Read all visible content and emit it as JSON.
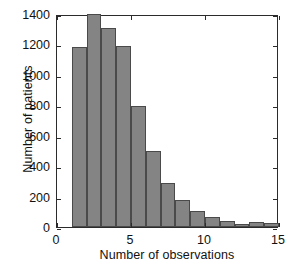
{
  "chart_data": {
    "type": "bar",
    "title": "",
    "subtitle": "",
    "xlabel": "Number of observations",
    "ylabel": "Number of patients",
    "xlim": [
      0,
      15
    ],
    "ylim": [
      0,
      1400
    ],
    "xticks": [
      0,
      5,
      10,
      15
    ],
    "xtick_labels": [
      "0",
      "5",
      "10",
      "15"
    ],
    "yticks": [
      0,
      200,
      400,
      600,
      800,
      1000,
      1200,
      1400
    ],
    "ytick_labels": [
      "0",
      "200",
      "400",
      "600",
      "800",
      "1000",
      "1200",
      "1400"
    ],
    "grid": false,
    "legend": null,
    "bin_width": 1,
    "bin_edges": [
      1,
      2,
      3,
      4,
      5,
      6,
      7,
      8,
      9,
      10,
      11,
      12,
      13,
      14,
      15
    ],
    "categories": [
      "1-2",
      "2-3",
      "3-4",
      "4-5",
      "5-6",
      "6-7",
      "7-8",
      "8-9",
      "9-10",
      "10-11",
      "11-12",
      "12-13",
      "13-14",
      "14-15"
    ],
    "x": [
      1.5,
      2.5,
      3.5,
      4.5,
      5.5,
      6.5,
      7.5,
      8.5,
      9.5,
      10.5,
      11.5,
      12.5,
      13.5,
      14.5
    ],
    "values": [
      1180,
      1400,
      1310,
      1190,
      795,
      500,
      290,
      175,
      105,
      65,
      38,
      22,
      30,
      25
    ],
    "bar_color": "#848484",
    "bar_edge_color": "#4a4a4a",
    "axis_color": "#2b2b2b",
    "background_color": "#ffffff"
  },
  "axes": {
    "ylabel": "Number of patients",
    "xlabel": "Number of observations"
  }
}
